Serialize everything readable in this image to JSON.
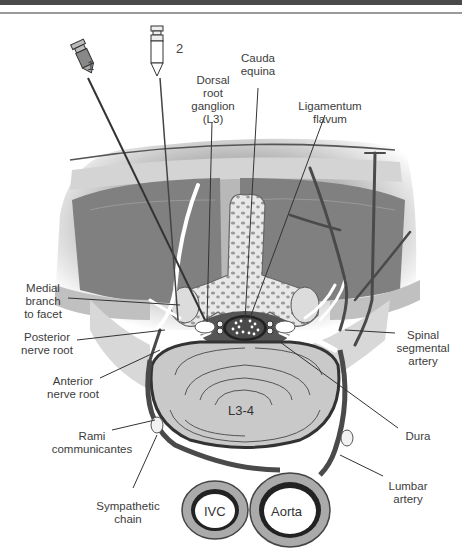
{
  "figure": {
    "header_bar": "",
    "needles": [
      {
        "id": "needle-1",
        "label": "1"
      },
      {
        "id": "needle-2",
        "label": "2"
      }
    ],
    "labels": {
      "cauda_equina": "Cauda\nequina",
      "dorsal_root_ganglion": "Dorsal\nroot\nganglion\n(L3)",
      "ligamentum_flavum": "Ligamentum\nflavum",
      "medial_branch": "Medial\nbranch\nto facet",
      "posterior_nerve_root": "Posterior\nnerve root",
      "anterior_nerve_root": "Anterior\nnerve root",
      "rami_communicantes": "Rami\ncommunicantes",
      "sympathetic_chain": "Sympathetic\nchain",
      "spinal_segmental_artery": "Spinal\nsegmental\nartery",
      "dura": "Dura",
      "lumbar_artery": "Lumbar\nartery"
    },
    "structures": {
      "disc": "L3-4",
      "ivc": "IVC",
      "aorta": "Aorta"
    },
    "colors": {
      "muscle_dark": "#7f7f7f",
      "muscle_mid": "#a3a3a3",
      "skin": "#cfcfcf",
      "bone": "#e6e6e6",
      "disc": "#c8c8c8",
      "nerve": "#ffffff",
      "vessel": "#4a4a4a"
    }
  }
}
